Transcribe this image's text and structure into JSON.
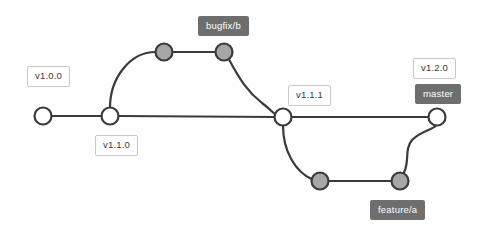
{
  "diagram": {
    "colors": {
      "background": "#fefefe",
      "edge": "#3a3a3a",
      "node_open_fill": "#ffffff",
      "node_filled_fill": "#a6a6a6",
      "tag_background": "#ffffff",
      "tag_border": "#c9c9c9",
      "tag_text": "#3a3a3a",
      "branch_background": "#6e6e6e",
      "branch_text": "#ffffff"
    },
    "tags": [
      {
        "id": "tag-v100",
        "text": "v1.0.0",
        "x": 27,
        "y": 66
      },
      {
        "id": "tag-v110",
        "text": "v1.1.0",
        "x": 95,
        "y": 135
      },
      {
        "id": "tag-v111",
        "text": "v1.1.1",
        "x": 288,
        "y": 85
      },
      {
        "id": "tag-v120",
        "text": "v1.2.0",
        "x": 413,
        "y": 58
      }
    ],
    "branches": [
      {
        "id": "branch-bugfix-b",
        "text": "bugfix/b",
        "x": 198,
        "y": 16
      },
      {
        "id": "branch-master",
        "text": "master",
        "x": 415,
        "y": 84
      },
      {
        "id": "branch-feature-a",
        "text": "feature/a",
        "x": 370,
        "y": 200
      }
    ],
    "nodes": [
      {
        "id": "commit-main-1",
        "type": "open",
        "cx": 43,
        "cy": 116,
        "r": 8.5
      },
      {
        "id": "commit-main-2",
        "type": "open",
        "cx": 110,
        "cy": 116,
        "r": 8.5
      },
      {
        "id": "commit-bugfix-1",
        "type": "filled",
        "cx": 164,
        "cy": 52,
        "r": 8.5
      },
      {
        "id": "commit-bugfix-2",
        "type": "filled",
        "cx": 224,
        "cy": 52,
        "r": 8.5
      },
      {
        "id": "commit-merge-111",
        "type": "open",
        "cx": 283,
        "cy": 117,
        "r": 8.5
      },
      {
        "id": "commit-feature-1",
        "type": "filled",
        "cx": 320,
        "cy": 181,
        "r": 8.5
      },
      {
        "id": "commit-feature-2",
        "type": "filled",
        "cx": 400,
        "cy": 181,
        "r": 8.5
      },
      {
        "id": "commit-master-head",
        "type": "open",
        "cx": 437,
        "cy": 117,
        "r": 8.5
      }
    ],
    "edges": [
      {
        "id": "edge-main-1-2",
        "d": "M 51.5 116 L 101.5 116"
      },
      {
        "id": "edge-main-2-111",
        "d": "M 118.5 116 L 274.5 117"
      },
      {
        "id": "edge-branch-bugfix-out",
        "d": "M 110 107.5 C 110 78 130 52 155.5 52"
      },
      {
        "id": "edge-bugfix-1-2",
        "d": "M 172.5 52 L 215.5 52"
      },
      {
        "id": "edge-bugfix-merge",
        "d": "M 229 59.5 C 240 80 248 92 262 103 C 270 109 272 112 275 114"
      },
      {
        "id": "edge-main-111-head",
        "d": "M 291.5 117 L 428.5 117"
      },
      {
        "id": "edge-feature-out",
        "d": "M 283 125.5 C 283 152 296 172 311.5 179"
      },
      {
        "id": "edge-feature-1-2",
        "d": "M 328.5 181 L 391.5 181"
      },
      {
        "id": "edge-feature-merge",
        "d": "M 404 172.5 C 410 160 404 150 412 140 C 422 130 433 130 436 125.5"
      }
    ]
  }
}
